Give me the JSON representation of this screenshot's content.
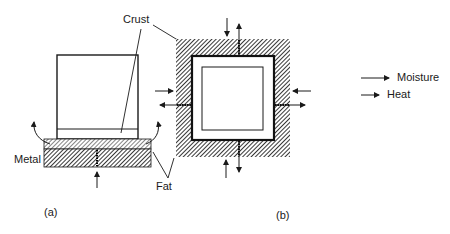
{
  "labels": {
    "crust": "Crust",
    "metal": "Metal",
    "fat": "Fat",
    "panel_a": "(a)",
    "panel_b": "(b)"
  },
  "legend": {
    "items": [
      {
        "label": "Moisture",
        "style": "long-arrow"
      },
      {
        "label": "Heat",
        "style": "short-arrow"
      }
    ]
  },
  "colors": {
    "ink": "#1a1a1a",
    "hatch": "#2a2a2a",
    "background": "#ffffff"
  }
}
